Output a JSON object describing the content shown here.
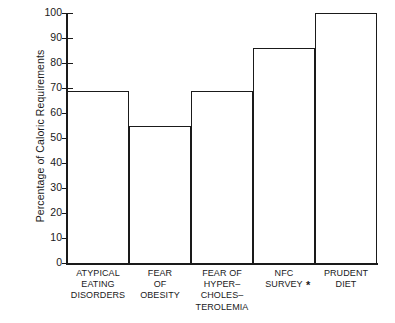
{
  "chart_data": {
    "type": "bar",
    "title": "",
    "xlabel": "",
    "ylabel": "Percentage of Caloric Requirements",
    "ylim": [
      0,
      100
    ],
    "yticks": [
      0,
      10,
      20,
      30,
      40,
      50,
      60,
      70,
      80,
      90,
      100
    ],
    "ytick_labels": [
      "0",
      "10",
      "20",
      "30",
      "40",
      "50",
      "60",
      "70",
      "80",
      "90",
      "100"
    ],
    "grid": false,
    "legend": "none",
    "categories": [
      "ATYPICAL EATING DISORDERS",
      "FEAR OF OBESITY",
      "FEAR OF HYPER-CHOLES-TEROLEMIA",
      "NFC SURVEY",
      "PRUDENT DIET"
    ],
    "category_lines": [
      [
        "ATYPICAL",
        "EATING",
        "DISORDERS"
      ],
      [
        "FEAR",
        "OF",
        "OBESITY"
      ],
      [
        "FEAR OF",
        "HYPER–",
        "CHOLES–",
        "TEROLEMIA"
      ],
      [
        "NFC",
        "SURVEY"
      ],
      [
        "PRUDENT",
        "DIET"
      ]
    ],
    "values": [
      69,
      55,
      69,
      86,
      100
    ],
    "annotations": [
      {
        "name": "asterisk-footnote-marker",
        "text": "*",
        "near_category": "PRUDENT DIET"
      }
    ],
    "colors": {
      "bar_fill": "#ffffff",
      "bar_outline": "#1a1a1a",
      "axis": "#1a1a1a",
      "background": "#ffffff",
      "text": "#1a1a1a"
    }
  }
}
